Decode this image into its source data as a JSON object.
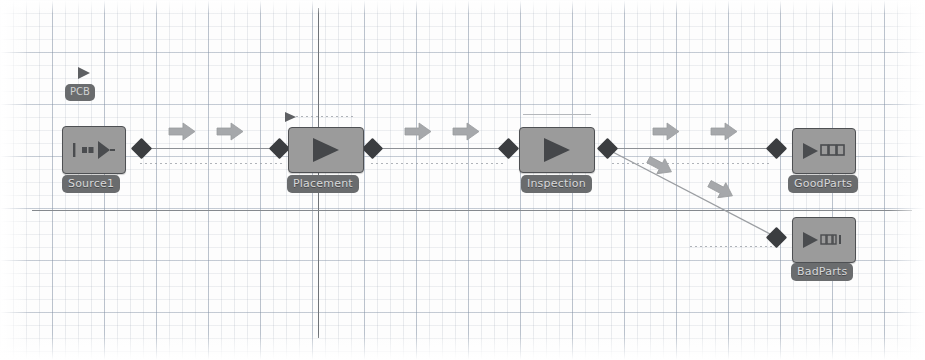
{
  "canvas": {
    "width": 925,
    "height": 360,
    "background_color": "#fdfdfd",
    "grid_minor_color": "#96a0af",
    "grid_major_color": "#8291a5",
    "axis_color": "#6f7378"
  },
  "palette": {
    "block_fill": "#9b9b9b",
    "block_border": "#4e5053",
    "block_glyph": "#4a4c4f",
    "port_color": "#3b3d40",
    "label_fill": "#6a6c6e",
    "label_text": "#d7d8d9",
    "link_color": "#8d9095",
    "arrow_color": "#a3a5a8"
  },
  "blocks": [
    {
      "id": "source1",
      "label": "Source1",
      "icon": "source-generator-icon",
      "x": 62,
      "y": 126,
      "w": 62,
      "h": 46,
      "label_x": 62,
      "label_y": 175
    },
    {
      "id": "placement",
      "label": "Placement",
      "icon": "process-play-icon",
      "x": 288,
      "y": 127,
      "w": 74,
      "h": 44,
      "label_x": 287,
      "label_y": 175
    },
    {
      "id": "inspection",
      "label": "Inspection",
      "icon": "process-play-icon",
      "x": 519,
      "y": 127,
      "w": 74,
      "h": 44,
      "label_x": 521,
      "label_y": 175
    },
    {
      "id": "goodparts",
      "label": "GoodParts",
      "icon": "sink-queue-icon",
      "x": 792,
      "y": 128,
      "w": 62,
      "h": 44,
      "label_x": 788,
      "label_y": 175
    },
    {
      "id": "badparts",
      "label": "BadParts",
      "icon": "sink-queue-icon",
      "x": 792,
      "y": 217,
      "w": 62,
      "h": 44,
      "label_x": 791,
      "label_y": 263
    }
  ],
  "entity": {
    "label": "PCB",
    "x": 65,
    "y": 84,
    "marker_x": 76,
    "marker_y": 66
  },
  "ports": [
    {
      "id": "source1-out",
      "x": 134,
      "y": 141
    },
    {
      "id": "placement-in",
      "x": 272,
      "y": 141
    },
    {
      "id": "placement-out",
      "x": 365,
      "y": 141
    },
    {
      "id": "inspection-in",
      "x": 501,
      "y": 141
    },
    {
      "id": "inspection-out",
      "x": 600,
      "y": 141
    },
    {
      "id": "goodparts-in",
      "x": 769,
      "y": 141
    },
    {
      "id": "badparts-in",
      "x": 769,
      "y": 230
    }
  ],
  "links": [
    {
      "id": "source1-to-placement",
      "type": "solid",
      "x": 140,
      "y": 148,
      "w": 140
    },
    {
      "id": "placement-to-inspection",
      "type": "solid",
      "x": 371,
      "y": 148,
      "w": 138
    },
    {
      "id": "inspection-to-goodparts",
      "type": "solid",
      "x": 606,
      "y": 148,
      "w": 170
    },
    {
      "id": "source1-dotted-guide",
      "type": "dotted",
      "x": 140,
      "y": 163,
      "w": 145
    },
    {
      "id": "placement-dotted-guide",
      "type": "dotted",
      "x": 371,
      "y": 163,
      "w": 135
    },
    {
      "id": "inspection-dotted-guide",
      "type": "dotted",
      "x": 612,
      "y": 163,
      "w": 160
    },
    {
      "id": "badparts-dotted-guide",
      "type": "dotted",
      "x": 690,
      "y": 246,
      "w": 85
    },
    {
      "id": "placement-top-guide",
      "type": "dotted",
      "x": 296,
      "y": 116,
      "w": 58
    },
    {
      "id": "inspection-top-guide",
      "type": "solid-light",
      "x": 523,
      "y": 114,
      "w": 68
    }
  ],
  "diagonal_link": {
    "id": "inspection-to-badparts",
    "x1": 607,
    "y1": 149,
    "x2": 772,
    "y2": 235
  },
  "flow_arrows": [
    {
      "id": "flow-1",
      "x": 168,
      "y": 122,
      "rotation": 0
    },
    {
      "id": "flow-2",
      "x": 216,
      "y": 122,
      "rotation": 0
    },
    {
      "id": "flow-3",
      "x": 404,
      "y": 122,
      "rotation": 0
    },
    {
      "id": "flow-4",
      "x": 452,
      "y": 122,
      "rotation": 0
    },
    {
      "id": "flow-5",
      "x": 652,
      "y": 122,
      "rotation": 0
    },
    {
      "id": "flow-6",
      "x": 710,
      "y": 122,
      "rotation": 0
    },
    {
      "id": "flow-branch-1",
      "x": 645,
      "y": 156,
      "rotation": 28
    },
    {
      "id": "flow-branch-2",
      "x": 706,
      "y": 180,
      "rotation": 28
    }
  ],
  "tri_markers": [
    {
      "id": "placement-entity-marker",
      "x": 284,
      "y": 108
    }
  ]
}
